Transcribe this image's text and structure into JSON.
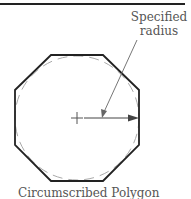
{
  "diagram": {
    "label_line1": "Specified",
    "label_line2": "radius",
    "caption": "Circumscribed Polygon",
    "shape": "octagon",
    "colors": {
      "outline": "#222222",
      "circle": "#999999",
      "text": "#555555"
    }
  }
}
